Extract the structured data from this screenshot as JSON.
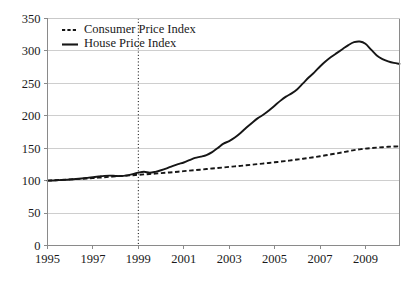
{
  "chart_data": {
    "type": "line",
    "title": "",
    "subtitle": "",
    "xlabel": "",
    "ylabel": "",
    "xlim": [
      1995,
      2010.5
    ],
    "ylim": [
      0,
      350
    ],
    "grid": true,
    "y_ticks": [
      0,
      50,
      100,
      150,
      200,
      250,
      300,
      350
    ],
    "y_tick_labels": [
      "0",
      "50",
      "100",
      "150",
      "200",
      "250",
      "300",
      "350"
    ],
    "x_ticks": [
      1995,
      1997,
      1999,
      2001,
      2003,
      2005,
      2007,
      2009
    ],
    "x_tick_labels": [
      "1995",
      "1997",
      "1999",
      "2001",
      "2003",
      "2005",
      "2007",
      "2009"
    ],
    "legend_position": "top-left",
    "annotations": [
      {
        "name": "vertical-marker-1999",
        "type": "vline",
        "x": 1999,
        "style": "dotted",
        "label": ""
      }
    ],
    "series": [
      {
        "name": "Consumer Price Index",
        "style": "dashed",
        "color": "#161616",
        "x": [
          1995.0,
          1995.25,
          1995.5,
          1995.75,
          1996.0,
          1996.25,
          1996.5,
          1996.75,
          1997.0,
          1997.25,
          1997.5,
          1997.75,
          1998.0,
          1998.25,
          1998.5,
          1998.75,
          1999.0,
          1999.25,
          1999.5,
          1999.75,
          2000.0,
          2000.25,
          2000.5,
          2000.75,
          2001.0,
          2001.25,
          2001.5,
          2001.75,
          2002.0,
          2002.25,
          2002.5,
          2002.75,
          2003.0,
          2003.25,
          2003.5,
          2003.75,
          2004.0,
          2004.25,
          2004.5,
          2004.75,
          2005.0,
          2005.25,
          2005.5,
          2005.75,
          2006.0,
          2006.25,
          2006.5,
          2006.75,
          2007.0,
          2007.25,
          2007.5,
          2007.75,
          2008.0,
          2008.25,
          2008.5,
          2008.75,
          2009.0,
          2009.25,
          2009.5,
          2009.75,
          2010.0,
          2010.25,
          2010.5
        ],
        "values": [
          100.0,
          100.5,
          101.0,
          101.4,
          101.9,
          102.4,
          102.9,
          103.4,
          104.0,
          104.6,
          105.2,
          105.9,
          106.6,
          107.2,
          107.8,
          108.4,
          109.0,
          109.6,
          110.2,
          110.9,
          111.6,
          112.3,
          113.0,
          113.8,
          114.6,
          115.4,
          116.2,
          117.0,
          117.9,
          118.7,
          119.5,
          120.3,
          121.2,
          122.0,
          122.8,
          123.7,
          124.6,
          125.5,
          126.4,
          127.3,
          128.3,
          129.3,
          130.3,
          131.4,
          132.6,
          133.8,
          135.0,
          136.3,
          137.7,
          139.1,
          140.6,
          142.1,
          143.7,
          145.4,
          147.0,
          148.3,
          149.4,
          150.2,
          150.9,
          151.6,
          152.2,
          152.6,
          152.9
        ]
      },
      {
        "name": "House Price Index",
        "style": "solid",
        "color": "#161616",
        "x": [
          1995.0,
          1995.25,
          1995.5,
          1995.75,
          1996.0,
          1996.25,
          1996.5,
          1996.75,
          1997.0,
          1997.25,
          1997.5,
          1997.75,
          1998.0,
          1998.25,
          1998.5,
          1998.75,
          1999.0,
          1999.25,
          1999.5,
          1999.75,
          2000.0,
          2000.25,
          2000.5,
          2000.75,
          2001.0,
          2001.25,
          2001.5,
          2001.75,
          2002.0,
          2002.25,
          2002.5,
          2002.75,
          2003.0,
          2003.25,
          2003.5,
          2003.75,
          2004.0,
          2004.25,
          2004.5,
          2004.75,
          2005.0,
          2005.25,
          2005.5,
          2005.75,
          2006.0,
          2006.25,
          2006.5,
          2006.75,
          2007.0,
          2007.25,
          2007.5,
          2007.75,
          2008.0,
          2008.25,
          2008.5,
          2008.75,
          2009.0,
          2009.25,
          2009.5,
          2009.75,
          2010.0,
          2010.25,
          2010.5
        ],
        "values": [
          100.0,
          100.3,
          100.8,
          101.2,
          101.8,
          102.6,
          103.4,
          104.2,
          105.2,
          106.3,
          107.4,
          107.8,
          107.2,
          107.0,
          108.2,
          110.0,
          112.3,
          113.8,
          112.2,
          113.6,
          116.0,
          119.0,
          122.5,
          125.5,
          128.0,
          131.5,
          135.0,
          137.0,
          139.5,
          144.0,
          150.5,
          157.0,
          161.0,
          166.5,
          173.5,
          181.5,
          189.0,
          196.0,
          201.5,
          208.0,
          215.5,
          223.0,
          229.5,
          234.5,
          241.0,
          250.0,
          259.0,
          267.0,
          276.0,
          284.0,
          291.0,
          297.0,
          303.0,
          309.0,
          313.5,
          314.5,
          311.0,
          302.0,
          293.0,
          287.5,
          284.0,
          281.5,
          280.0
        ]
      }
    ],
    "legend": [
      {
        "label": "Consumer Price Index",
        "style": "dashed"
      },
      {
        "label": "House Price Index",
        "style": "solid"
      }
    ]
  },
  "colors": {
    "series_line": "#161616",
    "gridline": "#c9c9c9",
    "axis": "#8a8a8a",
    "background": "#ffffff",
    "text": "#1a1a1a"
  }
}
